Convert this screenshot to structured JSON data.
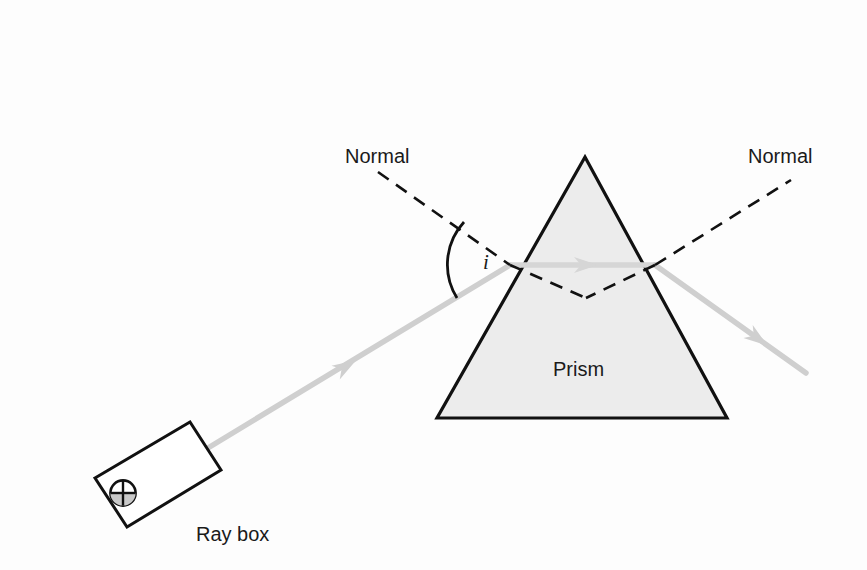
{
  "figure": {
    "width": 867,
    "height": 570,
    "background_color": "#fdfdfd"
  },
  "labels": {
    "normal_left": "Normal",
    "normal_right": "Normal",
    "prism": "Prism",
    "ray_box": "Ray box",
    "angle_of_incidence": "i"
  },
  "colors": {
    "outline": "#111111",
    "prism_fill": "#ececec",
    "ray": "#cfcfcf",
    "ray_arrow": "#cfcfcf",
    "normal_dash": "#111111",
    "text": "#1a1a1a",
    "ray_box_fill": "#ffffff",
    "lamp_shade": "#c9c9c9"
  },
  "geometry": {
    "prism": {
      "apex": [
        585,
        157
      ],
      "base_left": [
        437,
        418
      ],
      "base_right": [
        727,
        418
      ]
    },
    "entry_point": [
      510,
      265
    ],
    "exit_point": [
      655,
      265
    ],
    "normal_left": {
      "start": [
        378,
        172
      ],
      "end": [
        510,
        265
      ]
    },
    "normal_left_internal": {
      "start": [
        510,
        265
      ],
      "end": [
        585,
        297
      ]
    },
    "normal_right": {
      "start": [
        655,
        265
      ],
      "end": [
        790,
        180
      ]
    },
    "normal_right_internal": {
      "start": [
        655,
        265
      ],
      "end": [
        585,
        297
      ]
    },
    "incident_ray": {
      "start": [
        132,
        494
      ],
      "end": [
        510,
        265
      ]
    },
    "incident_arrow_at": [
      345,
      367
    ],
    "internal_ray": {
      "start": [
        510,
        265
      ],
      "end": [
        655,
        265
      ]
    },
    "internal_arrow_at": [
      583,
      265
    ],
    "exit_ray": {
      "start": [
        655,
        265
      ],
      "end": [
        805,
        372
      ]
    },
    "exit_arrow_at": [
      755,
      337
    ],
    "ray_box": {
      "corners": [
        [
          95,
          478
        ],
        [
          190,
          422
        ],
        [
          221,
          470
        ],
        [
          127,
          527
        ]
      ],
      "rotation_deg": -30
    },
    "lamp_circle": {
      "center": [
        123,
        493
      ],
      "radius": 13
    },
    "angle_arc": {
      "vertex": [
        510,
        265
      ],
      "radius": 62
    }
  },
  "annotations": {
    "normal_left_pos": [
      345,
      163
    ],
    "normal_right_pos": [
      748,
      163
    ],
    "prism_pos": [
      553,
      376
    ],
    "ray_box_pos": [
      196,
      541
    ],
    "angle_label_pos": [
      483,
      268
    ]
  }
}
